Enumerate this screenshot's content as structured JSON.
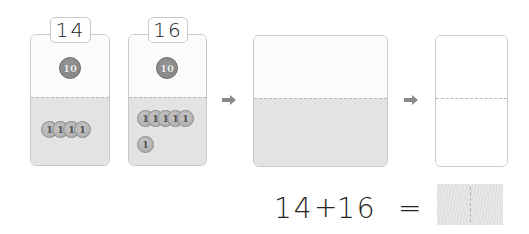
{
  "cards": [
    {
      "label": "14",
      "tens": [
        {
          "value": "10"
        }
      ],
      "ones": [
        {
          "value": "1"
        },
        {
          "value": "1"
        },
        {
          "value": "1"
        },
        {
          "value": "1"
        }
      ]
    },
    {
      "label": "16",
      "tens": [
        {
          "value": "10"
        }
      ],
      "ones": [
        {
          "value": "1"
        },
        {
          "value": "1"
        },
        {
          "value": "1"
        },
        {
          "value": "1"
        },
        {
          "value": "1"
        },
        {
          "value": "1"
        }
      ]
    }
  ],
  "combined_card": {
    "tens": [],
    "ones": []
  },
  "result_card": {
    "tens": [],
    "ones": []
  },
  "arrows": [
    "arrow-right-icon",
    "arrow-right-icon"
  ],
  "equation": {
    "left": "14",
    "operator": "+",
    "right": "16",
    "equals": "=",
    "answer": ""
  },
  "colors": {
    "tens_coin": "#858585",
    "ones_coin": "#b5b5b5",
    "card_top": "#fbfbfb",
    "card_bottom": "#e3e3e3",
    "border": "#c9c9c9",
    "arrow": "#8a8a8a"
  }
}
